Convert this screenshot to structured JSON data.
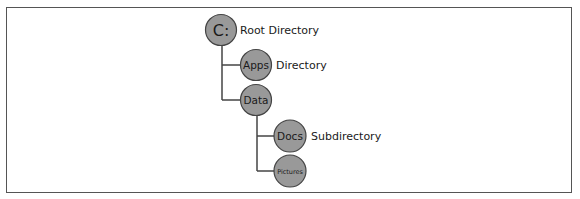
{
  "diagram": {
    "type": "directory-tree",
    "colors": {
      "node_fill": "#999999",
      "node_stroke": "#444444",
      "line": "#444444",
      "border": "#555555"
    },
    "nodes": [
      {
        "id": "c",
        "label": "C:",
        "desc": "Root Directory",
        "level": 0
      },
      {
        "id": "apps",
        "label": "Apps",
        "desc": "Directory",
        "level": 1,
        "parent": "c"
      },
      {
        "id": "data",
        "label": "Data",
        "desc": "",
        "level": 1,
        "parent": "c"
      },
      {
        "id": "docs",
        "label": "Docs",
        "desc": "Subdirectory",
        "level": 2,
        "parent": "data"
      },
      {
        "id": "pictures",
        "label": "Pictures",
        "desc": "",
        "level": 2,
        "parent": "data"
      }
    ]
  }
}
